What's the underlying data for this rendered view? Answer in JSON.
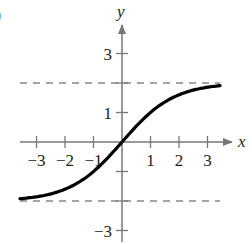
{
  "panel_fragment": ")",
  "chart_data": {
    "type": "line",
    "title": "",
    "xlabel": "x",
    "ylabel": "y",
    "xlim": [
      -3.5,
      3.6
    ],
    "ylim": [
      -3.5,
      3.9
    ],
    "xticks": [
      -3,
      -2,
      -1,
      1,
      2,
      3
    ],
    "xtick_labels": [
      "−3",
      "−2",
      "−1",
      "1",
      "2",
      "3"
    ],
    "yticks": [
      -3,
      -2,
      -1,
      1,
      2,
      3
    ],
    "ytick_labels_shown": {
      "3": "3",
      "1": "1",
      "-3": "−3"
    },
    "grid": false,
    "asymptotes": [
      {
        "y": 2,
        "style": "dashed"
      },
      {
        "y": -2,
        "style": "dashed"
      }
    ],
    "series": [
      {
        "name": "curve",
        "color": "#000000",
        "x": [
          -3.6,
          -3,
          -2.5,
          -2,
          -1.5,
          -1,
          -0.5,
          0,
          0.5,
          1,
          1.5,
          2,
          2.5,
          3,
          3.4
        ],
        "y": [
          -1.79,
          -1.86,
          -1.76,
          -1.6,
          -1.36,
          -1.0,
          -0.54,
          0,
          0.54,
          1.0,
          1.36,
          1.6,
          1.76,
          1.86,
          1.91
        ]
      }
    ],
    "colors": {
      "axis": "#777777",
      "curve": "#000000",
      "asymptote": "#888888",
      "text": "#222222"
    }
  }
}
